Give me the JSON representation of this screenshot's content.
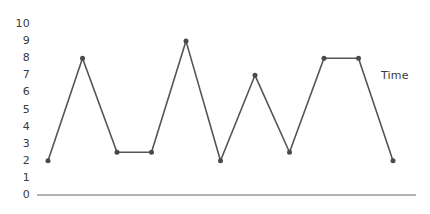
{
  "chart_data": {
    "type": "line",
    "title": "",
    "xlabel": "Time",
    "ylabel": "",
    "ylim": [
      0,
      10
    ],
    "grid": false,
    "legend": null,
    "markers": true,
    "line_color": "#555555",
    "marker_color": "#4a4a4a",
    "axis_color": "#9a9a9a",
    "x": [
      1,
      2,
      3,
      4,
      5,
      6,
      7,
      8,
      9,
      10,
      11
    ],
    "values": [
      2,
      8,
      2.5,
      2.5,
      9,
      2,
      7,
      2.5,
      8,
      8,
      2
    ],
    "y_ticks": [
      10,
      9,
      8,
      7,
      6,
      5,
      4,
      3,
      2,
      1,
      0
    ],
    "y_tick_labels": [
      "10",
      "9",
      "8",
      "7",
      "6",
      "5",
      "4",
      "3",
      "2",
      "1",
      "0"
    ],
    "x_tick_labels": [],
    "annotations": [
      {
        "text": "Time",
        "role": "x-axis-label",
        "position": "right"
      }
    ]
  },
  "axis": {
    "time_label": "Time"
  }
}
